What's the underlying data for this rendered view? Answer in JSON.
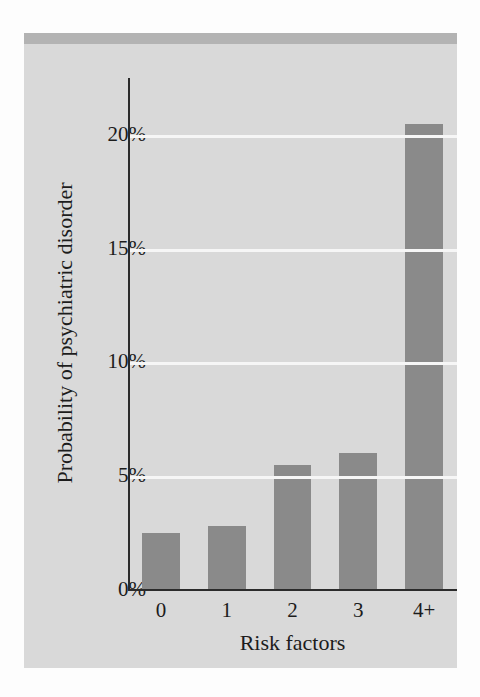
{
  "chart_data": {
    "type": "bar",
    "title": "",
    "subtitle": "",
    "xlabel": "Risk factors",
    "ylabel": "Probability of psychiatric disorder",
    "categories": [
      "0",
      "1",
      "2",
      "3",
      "4+"
    ],
    "values": [
      2.5,
      2.8,
      5.5,
      6.0,
      20.5
    ],
    "value_unit": "%",
    "ylim": [
      0,
      22.5
    ],
    "ytick_labels": [
      "0%",
      "5%",
      "10%",
      "15%",
      "20%"
    ],
    "ytick_values": [
      0,
      5,
      10,
      15,
      20
    ],
    "grid": "horizontal-only",
    "legend": "none",
    "series": [
      {
        "name": "Probability of psychiatric disorder",
        "values": [
          2.5,
          2.8,
          5.5,
          6.0,
          20.5
        ]
      }
    ]
  },
  "colors": {
    "bar_fill": "#8a8a8a",
    "panel_background": "#d9d9d9",
    "panel_top_strip": "#b3b3b3",
    "gridline": "#f6f6f6",
    "axis_line": "#2b2b2b",
    "text": "#1c1c1c",
    "page_background": "#fdfdfd"
  }
}
